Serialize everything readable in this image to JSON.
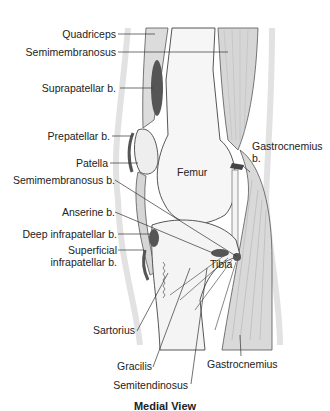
{
  "diagram": {
    "title": "Medial View",
    "labels": {
      "quadriceps": "Quadriceps",
      "semimembranosus": "Semimembranosus",
      "suprapatellar": "Suprapatellar b.",
      "prepatellar": "Prepatellar b.",
      "patella": "Patella",
      "semimembranosus_b": "Semimembranosus b.",
      "anserine": "Anserine b.",
      "deep_infrapatellar": "Deep infrapatellar b.",
      "superficial_infrapatellar_1": "Superficial",
      "superficial_infrapatellar_2": "infrapatellar b.",
      "femur": "Femur",
      "tibia": "Tibia",
      "gastrocnemius_b_1": "Gastrocnemius",
      "gastrocnemius_b_2": "b.",
      "sartorius": "Sartorius",
      "gracilis": "Gracilis",
      "semitendinosus": "Semitendinosus",
      "gastrocnemius": "Gastrocnemius"
    },
    "colors": {
      "bursa": "#555555",
      "muscle": "#d9d9d9",
      "bone": "#f4f4f4",
      "outline": "#444444",
      "skin": "#ececec"
    }
  }
}
